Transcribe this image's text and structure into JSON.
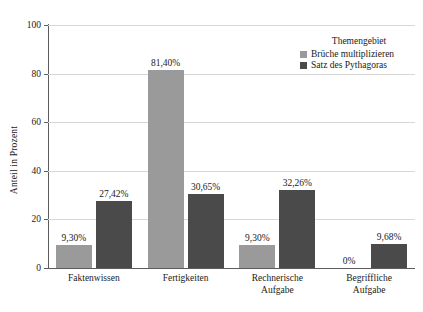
{
  "chart_data": {
    "type": "bar",
    "title": "",
    "xlabel": "",
    "ylabel": "Anteil in Prozent",
    "ylim": [
      0,
      100
    ],
    "yticks": [
      0,
      20,
      40,
      60,
      80,
      100
    ],
    "ytick_labels": [
      "0",
      "20",
      "40",
      "60",
      "80",
      "100"
    ],
    "grid": true,
    "legend_position": "top-right",
    "legend_title": "Themengebiet",
    "categories": [
      "Faktenwissen",
      "Fertigkeiten",
      "Rechnerische\nAufgabe",
      "Begriffliche\nAufgabe"
    ],
    "category_lines": [
      [
        "Faktenwissen"
      ],
      [
        "Fertigkeiten"
      ],
      [
        "Rechnerische",
        "Aufgabe"
      ],
      [
        "Begriffliche",
        "Aufgabe"
      ]
    ],
    "series": [
      {
        "name": "Brüche multiplizieren",
        "color": "#9a9a9a",
        "values": [
          9.3,
          81.4,
          9.3,
          0
        ],
        "labels": [
          "9,30%",
          "81,40%",
          "9,30%",
          "0%"
        ]
      },
      {
        "name": "Satz des Pythagoras",
        "color": "#4a4a4a",
        "values": [
          27.42,
          30.65,
          32.26,
          9.68
        ],
        "labels": [
          "27,42%",
          "30,65%",
          "32,26%",
          "9,68%"
        ]
      }
    ]
  },
  "colors": {
    "series_light": "#9a9a9a",
    "series_dark": "#4a4a4a",
    "axis": "#5c5c5c",
    "grid": "#d8d8d8",
    "text": "#1a1a1a",
    "background": "#ffffff"
  }
}
